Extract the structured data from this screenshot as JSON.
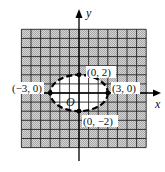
{
  "figure": {
    "type": "graph of inequality region",
    "axes": {
      "x_label": "x",
      "y_label": "y",
      "origin_label": "O"
    },
    "grid": {
      "units_left": 6,
      "units_right": 7,
      "units_up": 7,
      "units_down": 6,
      "cell_unit": 1,
      "shaded_color": "#bdbdbd"
    },
    "ellipse": {
      "center": [
        0,
        0
      ],
      "semi_x": 3,
      "semi_y": 2,
      "style": "dashed",
      "interior_shaded": false
    },
    "points": [
      {
        "label": "(0, 2)",
        "x": 0,
        "y": 2
      },
      {
        "label": "(-3, 0)",
        "display": "(−3, 0)",
        "x": -3,
        "y": 0
      },
      {
        "label": "(3, 0)",
        "x": 3,
        "y": 0
      },
      {
        "label": "(0, -2)",
        "display": "(0, −2)",
        "x": 0,
        "y": -2
      }
    ]
  },
  "labels": {
    "p_top": "(0, 2)",
    "p_left": "(−3, 0)",
    "p_right": "(3, 0)",
    "p_bottom": "(0, −2)",
    "x": "x",
    "y": "y",
    "o": "O"
  }
}
